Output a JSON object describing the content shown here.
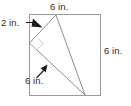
{
  "figure": {
    "shape": "square",
    "colors": {
      "square_stroke": "#9a9a9a",
      "triangle_stroke": "#8d8d8d",
      "arrow_fill": "#1a1a1a",
      "right_angle_stroke": "#c8c8c8",
      "text": "#2b2b2b",
      "background": "#ffffff"
    },
    "labels": {
      "top": "6 in.",
      "right": "6 in.",
      "left": "2 in.",
      "inner": "6 in."
    },
    "units": "in.",
    "square": {
      "side_length": 6,
      "top_label": "6 in.",
      "right_label": "6 in."
    },
    "triangle": {
      "left_offset_from_top_left_corner": 2,
      "left_offset_label": "2 in.",
      "hypotenuse_label": "6 in.",
      "has_right_angle_marker": true
    },
    "annotations": [
      {
        "name": "left-leader",
        "text": "2 in.",
        "points_to": "triangle-left-vertex"
      },
      {
        "name": "inner-leader",
        "text": "6 in.",
        "points_to": "triangle-long-side"
      }
    ]
  }
}
